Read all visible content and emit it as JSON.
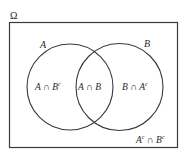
{
  "diagram": {
    "type": "venn",
    "universe": {
      "label": "Ω",
      "rect": {
        "x": 9.5,
        "y": 22.5,
        "width": 168,
        "height": 125
      }
    },
    "sets": [
      {
        "name": "A",
        "label": "A",
        "cx": 70,
        "cy": 87,
        "r": 43,
        "label_pos": {
          "x": 40,
          "y": 48
        }
      },
      {
        "name": "B",
        "label": "B",
        "cx": 119.5,
        "cy": 87,
        "r": 43.5,
        "label_pos": {
          "x": 144,
          "y": 47
        }
      }
    ],
    "regions": [
      {
        "id": "a-only",
        "base": "A ∩ B",
        "sup": "c",
        "pos": {
          "x": 35,
          "y": 90
        }
      },
      {
        "id": "a-and-b",
        "base": "A ∩ B",
        "sup": "",
        "pos": {
          "x": 78,
          "y": 90
        }
      },
      {
        "id": "b-only",
        "base": "B ∩ A",
        "sup": "c",
        "pos": {
          "x": 122,
          "y": 90
        }
      },
      {
        "id": "neither",
        "base1": "A",
        "sup1": "c",
        "mid": " ∩ B",
        "sup2": "c",
        "pos": {
          "x": 136,
          "y": 143
        }
      }
    ],
    "colors": {
      "stroke": "#3a3a3a",
      "text": "#2a2a2a",
      "background": "#ffffff"
    }
  }
}
